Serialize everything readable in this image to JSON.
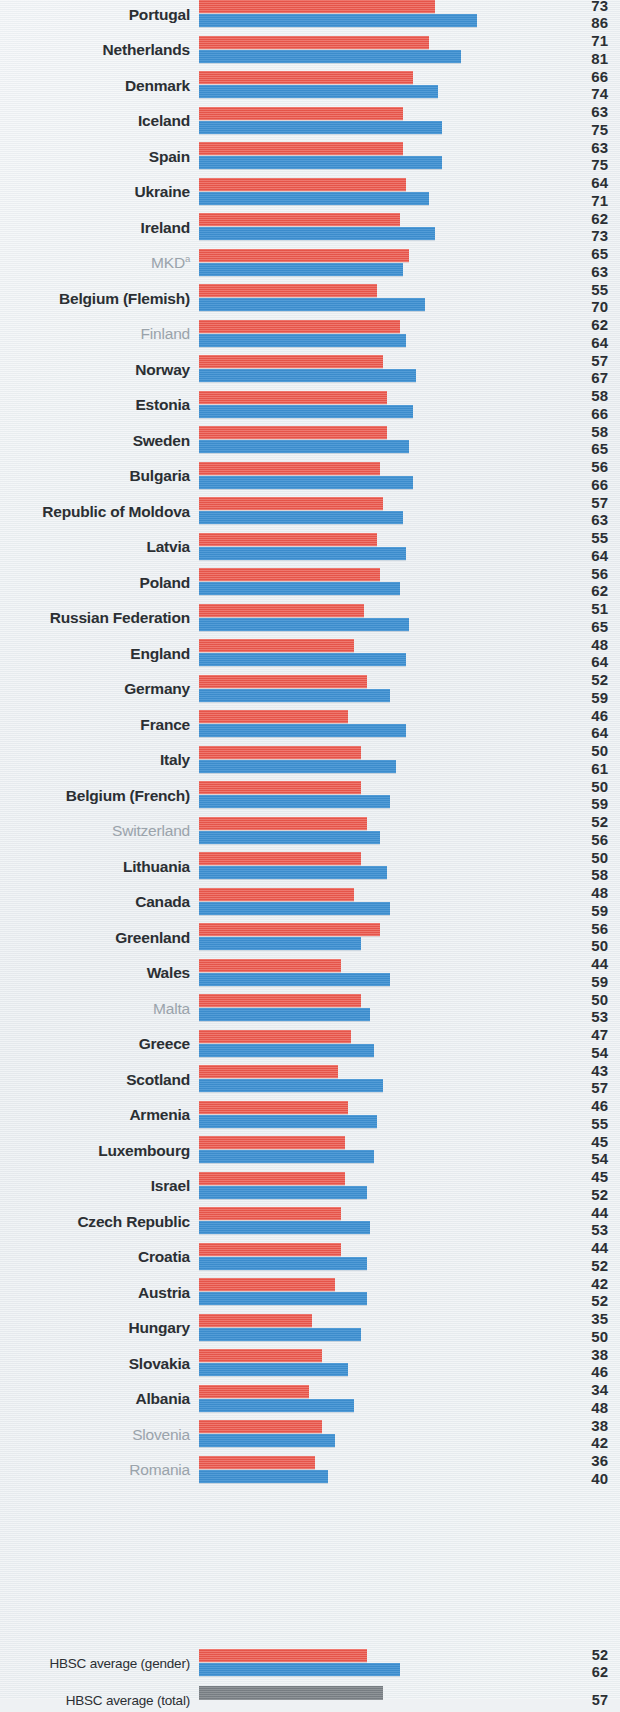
{
  "chart_data": {
    "type": "bar",
    "orientation": "horizontal",
    "title": "",
    "subtitle": "",
    "xlabel": "",
    "ylabel": "",
    "xlim": [
      0,
      90
    ],
    "grid": false,
    "legend_position": "none",
    "series": [
      {
        "name": "boys",
        "color": "#eb5a4f"
      },
      {
        "name": "girls",
        "color": "#3f91d2"
      },
      {
        "name": "total",
        "color": "#7e8489"
      }
    ],
    "categories": [
      "Portugal",
      "Netherlands",
      "Denmark",
      "Iceland",
      "Spain",
      "Ukraine",
      "Ireland",
      "MKD",
      "Belgium (Flemish)",
      "Finland",
      "Norway",
      "Estonia",
      "Sweden",
      "Bulgaria",
      "Republic of Moldova",
      "Latvia",
      "Poland",
      "Russian Federation",
      "England",
      "Germany",
      "France",
      "Italy",
      "Belgium (French)",
      "Switzerland",
      "Lithuania",
      "Canada",
      "Greenland",
      "Wales",
      "Malta",
      "Greece",
      "Scotland",
      "Armenia",
      "Luxembourg",
      "Israel",
      "Czech Republic",
      "Croatia",
      "Austria",
      "Hungary",
      "Slovakia",
      "Albania",
      "Slovenia",
      "Romania"
    ],
    "boys": [
      73,
      71,
      66,
      63,
      63,
      64,
      62,
      65,
      55,
      62,
      57,
      58,
      58,
      56,
      57,
      55,
      56,
      51,
      48,
      52,
      46,
      50,
      50,
      52,
      50,
      48,
      56,
      44,
      50,
      47,
      43,
      46,
      45,
      45,
      44,
      44,
      42,
      35,
      38,
      34,
      38,
      36
    ],
    "girls": [
      86,
      81,
      74,
      75,
      75,
      71,
      73,
      63,
      70,
      64,
      67,
      66,
      65,
      66,
      63,
      64,
      62,
      65,
      64,
      59,
      64,
      61,
      59,
      56,
      58,
      59,
      50,
      59,
      53,
      54,
      57,
      55,
      54,
      52,
      53,
      52,
      52,
      50,
      46,
      48,
      42,
      40
    ],
    "averages": [
      {
        "label": "HBSC average (gender)",
        "boys": 52,
        "girls": 62
      },
      {
        "label": "HBSC average (total)",
        "total": 57
      }
    ]
  },
  "rows": [
    {
      "label": "Portugal",
      "sup": "",
      "muted": false,
      "boys": 73,
      "girls": 86
    },
    {
      "label": "Netherlands",
      "sup": "",
      "muted": false,
      "boys": 71,
      "girls": 81
    },
    {
      "label": "Denmark",
      "sup": "",
      "muted": false,
      "boys": 66,
      "girls": 74
    },
    {
      "label": "Iceland",
      "sup": "",
      "muted": false,
      "boys": 63,
      "girls": 75
    },
    {
      "label": "Spain",
      "sup": "",
      "muted": false,
      "boys": 63,
      "girls": 75
    },
    {
      "label": "Ukraine",
      "sup": "",
      "muted": false,
      "boys": 64,
      "girls": 71
    },
    {
      "label": "Ireland",
      "sup": "",
      "muted": false,
      "boys": 62,
      "girls": 73
    },
    {
      "label": "MKD",
      "sup": "a",
      "muted": true,
      "boys": 65,
      "girls": 63
    },
    {
      "label": "Belgium (Flemish)",
      "sup": "",
      "muted": false,
      "boys": 55,
      "girls": 70
    },
    {
      "label": "Finland",
      "sup": "",
      "muted": true,
      "boys": 62,
      "girls": 64
    },
    {
      "label": "Norway",
      "sup": "",
      "muted": false,
      "boys": 57,
      "girls": 67
    },
    {
      "label": "Estonia",
      "sup": "",
      "muted": false,
      "boys": 58,
      "girls": 66
    },
    {
      "label": "Sweden",
      "sup": "",
      "muted": false,
      "boys": 58,
      "girls": 65
    },
    {
      "label": "Bulgaria",
      "sup": "",
      "muted": false,
      "boys": 56,
      "girls": 66
    },
    {
      "label": "Republic of Moldova",
      "sup": "",
      "muted": false,
      "boys": 57,
      "girls": 63
    },
    {
      "label": "Latvia",
      "sup": "",
      "muted": false,
      "boys": 55,
      "girls": 64
    },
    {
      "label": "Poland",
      "sup": "",
      "muted": false,
      "boys": 56,
      "girls": 62
    },
    {
      "label": "Russian Federation",
      "sup": "",
      "muted": false,
      "boys": 51,
      "girls": 65
    },
    {
      "label": "England",
      "sup": "",
      "muted": false,
      "boys": 48,
      "girls": 64
    },
    {
      "label": "Germany",
      "sup": "",
      "muted": false,
      "boys": 52,
      "girls": 59
    },
    {
      "label": "France",
      "sup": "",
      "muted": false,
      "boys": 46,
      "girls": 64
    },
    {
      "label": "Italy",
      "sup": "",
      "muted": false,
      "boys": 50,
      "girls": 61
    },
    {
      "label": "Belgium (French)",
      "sup": "",
      "muted": false,
      "boys": 50,
      "girls": 59
    },
    {
      "label": "Switzerland",
      "sup": "",
      "muted": true,
      "boys": 52,
      "girls": 56
    },
    {
      "label": "Lithuania",
      "sup": "",
      "muted": false,
      "boys": 50,
      "girls": 58
    },
    {
      "label": "Canada",
      "sup": "",
      "muted": false,
      "boys": 48,
      "girls": 59
    },
    {
      "label": "Greenland",
      "sup": "",
      "muted": false,
      "boys": 56,
      "girls": 50
    },
    {
      "label": "Wales",
      "sup": "",
      "muted": false,
      "boys": 44,
      "girls": 59
    },
    {
      "label": "Malta",
      "sup": "",
      "muted": true,
      "boys": 50,
      "girls": 53
    },
    {
      "label": "Greece",
      "sup": "",
      "muted": false,
      "boys": 47,
      "girls": 54
    },
    {
      "label": "Scotland",
      "sup": "",
      "muted": false,
      "boys": 43,
      "girls": 57
    },
    {
      "label": "Armenia",
      "sup": "",
      "muted": false,
      "boys": 46,
      "girls": 55
    },
    {
      "label": "Luxembourg",
      "sup": "",
      "muted": false,
      "boys": 45,
      "girls": 54
    },
    {
      "label": "Israel",
      "sup": "",
      "muted": false,
      "boys": 45,
      "girls": 52
    },
    {
      "label": "Czech Republic",
      "sup": "",
      "muted": false,
      "boys": 44,
      "girls": 53
    },
    {
      "label": "Croatia",
      "sup": "",
      "muted": false,
      "boys": 44,
      "girls": 52
    },
    {
      "label": "Austria",
      "sup": "",
      "muted": false,
      "boys": 42,
      "girls": 52
    },
    {
      "label": "Hungary",
      "sup": "",
      "muted": false,
      "boys": 35,
      "girls": 50
    },
    {
      "label": "Slovakia",
      "sup": "",
      "muted": false,
      "boys": 38,
      "girls": 46
    },
    {
      "label": "Albania",
      "sup": "",
      "muted": false,
      "boys": 34,
      "girls": 48
    },
    {
      "label": "Slovenia",
      "sup": "",
      "muted": true,
      "boys": 38,
      "girls": 42
    },
    {
      "label": "Romania",
      "sup": "",
      "muted": true,
      "boys": 36,
      "girls": 40
    }
  ],
  "footer_rows": [
    {
      "label": "HBSC average (gender)",
      "boys": 52,
      "girls": 62
    },
    {
      "label": "HBSC average (total)",
      "total": 57
    }
  ],
  "colors": {
    "boys": "#eb5a4f",
    "girls": "#3f91d2",
    "total": "#7e8489",
    "label": "#2b2f33",
    "label_muted": "#9aa3ab",
    "background": "#eef1f3"
  },
  "layout": {
    "bar_origin_x": 199,
    "px_per_unit": 3.235,
    "row_pitch": 35.5,
    "first_row_top": -3,
    "footer_first_top": 1646,
    "footer_pitch": 37
  }
}
